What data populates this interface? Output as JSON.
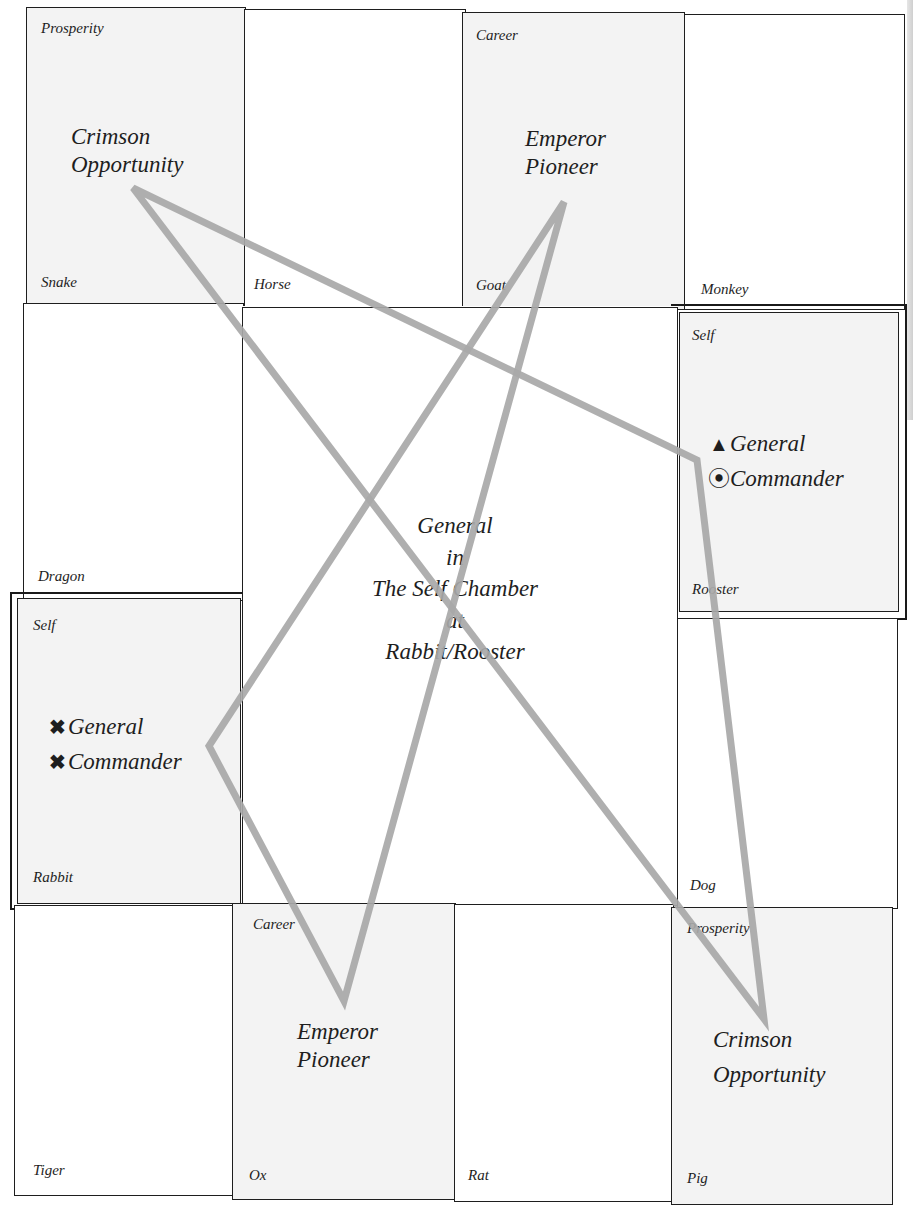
{
  "diagram": {
    "type": "Flying Star / Purple Star palace chart",
    "center": {
      "lines": [
        "General",
        "in",
        "The Self Chamber",
        "at",
        "Rabbit/Rooster"
      ]
    },
    "palaces": [
      {
        "id": "snake",
        "branch": "Snake",
        "chamber": "Prosperity",
        "star": [
          "Crimson",
          "Opportunity"
        ],
        "shaded": true
      },
      {
        "id": "horse",
        "branch": "Horse",
        "chamber": "",
        "star": [],
        "shaded": false
      },
      {
        "id": "goat",
        "branch": "Goat",
        "chamber": "Career",
        "star": [
          "Emperor",
          "Pioneer"
        ],
        "shaded": true
      },
      {
        "id": "monkey",
        "branch": "Monkey",
        "chamber": "",
        "star": [],
        "shaded": false
      },
      {
        "id": "dragon",
        "branch": "Dragon",
        "chamber": "",
        "star": [],
        "shaded": false
      },
      {
        "id": "rooster",
        "branch": "Rooster",
        "chamber": "Self",
        "star": [],
        "shaded": true
      },
      {
        "id": "rabbit",
        "branch": "Rabbit",
        "chamber": "Self",
        "star": [],
        "shaded": true
      },
      {
        "id": "dog",
        "branch": "Dog",
        "chamber": "",
        "star": [],
        "shaded": false
      },
      {
        "id": "tiger",
        "branch": "Tiger",
        "chamber": "",
        "star": [],
        "shaded": false
      },
      {
        "id": "ox",
        "branch": "Ox",
        "chamber": "Career",
        "star": [
          "Emperor",
          "Pioneer"
        ],
        "shaded": true
      },
      {
        "id": "rat",
        "branch": "Rat",
        "chamber": "",
        "star": [],
        "shaded": false
      },
      {
        "id": "pig",
        "branch": "Pig",
        "chamber": "Prosperity",
        "star": [
          "Crimson",
          "Opportunity"
        ],
        "shaded": true
      }
    ],
    "rooster_stars": [
      {
        "symbol": "▲",
        "symbol_name": "triangle-icon",
        "label": "General"
      },
      {
        "symbol": "⦿",
        "symbol_name": "circled-dot-icon",
        "label": "Commander"
      }
    ],
    "rabbit_stars": [
      {
        "symbol": "✖",
        "symbol_name": "cross-icon",
        "label": "General"
      },
      {
        "symbol": "✖",
        "symbol_name": "cross-icon",
        "label": "Commander"
      }
    ],
    "triangles": {
      "color": "#a8a8a8",
      "triangle_a": [
        [
          133,
          188
        ],
        [
          697,
          460
        ],
        [
          764,
          1019
        ]
      ],
      "triangle_b": [
        [
          564,
          202
        ],
        [
          209,
          746
        ],
        [
          344,
          1001
        ]
      ]
    },
    "colors": {
      "line": "#1e1e1e",
      "shaded_cell": "#f3f3f3",
      "triangle": "#a8a8a8"
    }
  }
}
